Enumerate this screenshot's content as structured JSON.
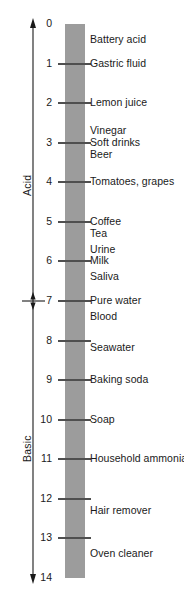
{
  "figure": {
    "width": 184,
    "height": 604,
    "background": "#ffffff",
    "caption": ""
  },
  "axis": {
    "orientation": "vertical",
    "arrow_top": true,
    "arrow_bottom": true,
    "divider_ph": 7,
    "divider_marker": "double-arrow-tick",
    "line_color": "#1a1a1a"
  },
  "ranges": [
    {
      "name": "acid",
      "label": "Acid",
      "ph_from": 0,
      "ph_to": 7,
      "rotated": true
    },
    {
      "name": "basic",
      "label": "Basic",
      "ph_from": 7,
      "ph_to": 14,
      "rotated": true
    }
  ],
  "bar": {
    "color": "#9c9c9c",
    "tick_color": "#4f4f4f",
    "ph_min": 0,
    "ph_max": 14
  },
  "chart_data": {
    "type": "bar",
    "xlabel": "",
    "ylabel": "pH",
    "ylim": [
      0,
      14
    ],
    "grid": false,
    "legend": "none",
    "orientation": "vertical",
    "axis_inverted": true,
    "tick_labels": [
      "0",
      "1",
      "2",
      "3",
      "4",
      "5",
      "6",
      "7",
      "8",
      "9",
      "10",
      "11",
      "12",
      "13",
      "14"
    ],
    "tick_values": [
      0,
      1,
      2,
      3,
      4,
      5,
      6,
      7,
      8,
      9,
      10,
      11,
      12,
      13,
      14
    ],
    "categories": [
      "Battery acid",
      "Gastric fluid",
      "Lemon juice",
      "Vinegar",
      "Soft drinks",
      "Beer",
      "Tomatoes, grapes",
      "Coffee",
      "Tea",
      "Urine",
      "Milk",
      "Saliva",
      "Pure water",
      "Blood",
      "Seawater",
      "Baking soda",
      "Soap",
      "Household ammonia",
      "Hair remover",
      "Oven cleaner"
    ],
    "values": [
      0.4,
      1.0,
      2.0,
      2.7,
      3.0,
      3.3,
      4.0,
      5.0,
      5.3,
      5.7,
      6.0,
      6.4,
      7.0,
      7.4,
      8.2,
      9.0,
      10.0,
      11.0,
      12.3,
      13.4
    ],
    "annotations": [
      {
        "label": "Acid",
        "ph_from": 0,
        "ph_to": 7
      },
      {
        "label": "Basic",
        "ph_from": 7,
        "ph_to": 14
      }
    ]
  },
  "substances": [
    {
      "label": "Battery acid",
      "ph": 0.4
    },
    {
      "label": "Gastric fluid",
      "ph": 1.0
    },
    {
      "label": "Lemon juice",
      "ph": 2.0
    },
    {
      "label": "Vinegar",
      "ph": 2.7
    },
    {
      "label": "Soft drinks",
      "ph": 3.0
    },
    {
      "label": "Beer",
      "ph": 3.3
    },
    {
      "label": "Tomatoes, grapes",
      "ph": 4.0
    },
    {
      "label": "Coffee",
      "ph": 5.0
    },
    {
      "label": "Tea",
      "ph": 5.3
    },
    {
      "label": "Urine",
      "ph": 5.7
    },
    {
      "label": "Milk",
      "ph": 6.0
    },
    {
      "label": "Saliva",
      "ph": 6.4
    },
    {
      "label": "Pure water",
      "ph": 7.0
    },
    {
      "label": "Blood",
      "ph": 7.4
    },
    {
      "label": "Seawater",
      "ph": 8.2
    },
    {
      "label": "Baking soda",
      "ph": 9.0
    },
    {
      "label": "Soap",
      "ph": 10.0
    },
    {
      "label": "Household ammonia",
      "ph": 11.0
    },
    {
      "label": "Hair remover",
      "ph": 12.3
    },
    {
      "label": "Oven cleaner",
      "ph": 13.4
    }
  ]
}
